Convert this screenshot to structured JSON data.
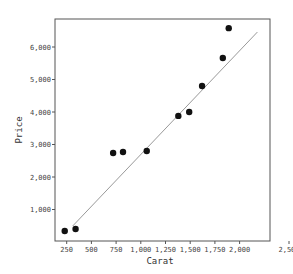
{
  "chart_data": {
    "type": "scatter",
    "title": "",
    "xlabel": "Carat",
    "ylabel": "Price",
    "xlim": [
      130,
      2580
    ],
    "ylim": [
      0,
      6800
    ],
    "grid": false,
    "legend": null,
    "x_ticks": [
      250,
      500,
      750,
      1000,
      1250,
      1500,
      1750,
      2000,
      2500
    ],
    "x_tick_labels": [
      "250",
      "500",
      "750",
      "1,000",
      "1,250",
      "1,500",
      "1,750",
      "2,000",
      "2,500"
    ],
    "y_ticks": [
      1000,
      2000,
      3000,
      4000,
      5000,
      6000
    ],
    "y_tick_labels": [
      "1,000",
      "2,000",
      "3,000",
      "4,000",
      "5,000",
      "6,000"
    ],
    "series": [
      {
        "name": "observations",
        "kind": "scatter",
        "color": "#111111",
        "points": [
          {
            "x": 230,
            "y": 340
          },
          {
            "x": 340,
            "y": 400
          },
          {
            "x": 720,
            "y": 2740
          },
          {
            "x": 820,
            "y": 2770
          },
          {
            "x": 1060,
            "y": 2800
          },
          {
            "x": 1380,
            "y": 3880
          },
          {
            "x": 1490,
            "y": 4000
          },
          {
            "x": 1620,
            "y": 4800
          },
          {
            "x": 1830,
            "y": 5660
          },
          {
            "x": 1890,
            "y": 6580
          }
        ]
      },
      {
        "name": "fit-line",
        "kind": "line",
        "color": "#999999",
        "points": [
          {
            "x": 310,
            "y": 490
          },
          {
            "x": 2180,
            "y": 6460
          }
        ]
      }
    ]
  }
}
